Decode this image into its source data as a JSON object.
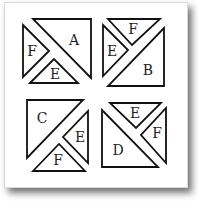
{
  "figure": {
    "colors": {
      "stroke": "#111111",
      "fill": "#ffffff",
      "label": "#222222"
    },
    "quadrants": [
      {
        "id": "top-left",
        "pieces": [
          {
            "label": "A",
            "shape": "large-triangle"
          },
          {
            "label": "F",
            "shape": "small-triangle"
          },
          {
            "label": "E",
            "shape": "small-triangle"
          }
        ]
      },
      {
        "id": "top-right",
        "pieces": [
          {
            "label": "F",
            "shape": "small-triangle"
          },
          {
            "label": "E",
            "shape": "small-triangle"
          },
          {
            "label": "B",
            "shape": "large-triangle"
          }
        ]
      },
      {
        "id": "bottom-left",
        "pieces": [
          {
            "label": "C",
            "shape": "large-triangle"
          },
          {
            "label": "E",
            "shape": "small-triangle"
          },
          {
            "label": "F",
            "shape": "small-triangle"
          }
        ]
      },
      {
        "id": "bottom-right",
        "pieces": [
          {
            "label": "E",
            "shape": "small-triangle"
          },
          {
            "label": "F",
            "shape": "small-triangle"
          },
          {
            "label": "D",
            "shape": "large-triangle"
          }
        ]
      }
    ]
  }
}
